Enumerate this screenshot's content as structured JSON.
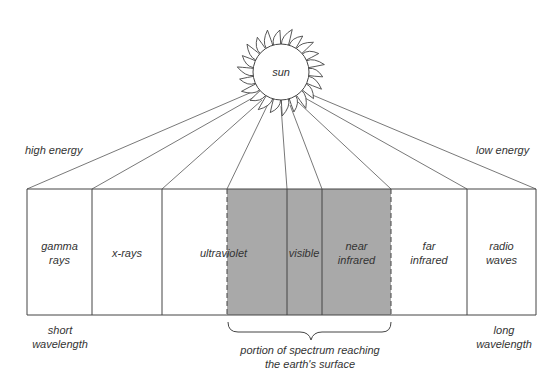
{
  "sun": {
    "label": "sun"
  },
  "energy": {
    "high": "high energy",
    "low": "low energy"
  },
  "wavelength": {
    "short": "short wavelength",
    "short_l1": "short",
    "short_l2": "wavelength",
    "long_l1": "long",
    "long_l2": "wavelength"
  },
  "bands": [
    {
      "l1": "gamma",
      "l2": "rays"
    },
    {
      "l1": "x-rays",
      "l2": ""
    },
    {
      "l1": "ultraviolet",
      "l2": ""
    },
    {
      "l1": "visible",
      "l2": ""
    },
    {
      "l1": "near",
      "l2": "infrared"
    },
    {
      "l1": "far",
      "l2": "infrared"
    },
    {
      "l1": "radio",
      "l2": "waves"
    }
  ],
  "brace": {
    "l1": "portion of spectrum reaching",
    "l2": "the earth's surface"
  },
  "colors": {
    "shaded": "#a9a9a9",
    "line": "#444444"
  }
}
